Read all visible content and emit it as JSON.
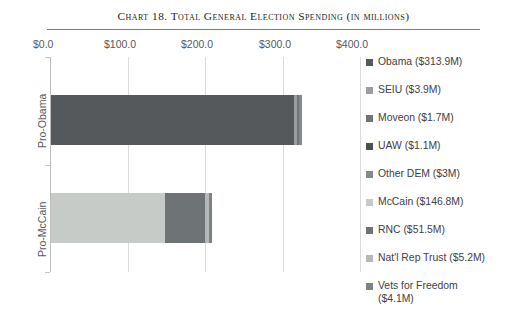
{
  "chart_data": {
    "type": "bar",
    "orientation": "horizontal",
    "stacked": true,
    "title": "Chart 18.  Total General Election Spending (in millions)",
    "xlabel": "",
    "ylabel": "",
    "categories": [
      "Pro-Obama",
      "Pro-McCain"
    ],
    "xlim": [
      0,
      400
    ],
    "xticks": [
      0,
      100,
      200,
      300,
      400
    ],
    "xtick_labels": [
      "$0.0",
      "$100.0",
      "$200.0",
      "$300.0",
      "$400.0"
    ],
    "grid": true,
    "legend_position": "right",
    "units": "millions of dollars",
    "series": [
      {
        "name": "Obama",
        "label": "Obama ($313.9M)",
        "color": "#55595b",
        "values": [
          313.9,
          0
        ]
      },
      {
        "name": "SEIU",
        "label": "SEIU ($3.9M)",
        "color": "#9b9fa1",
        "values": [
          3.9,
          0
        ]
      },
      {
        "name": "Moveon",
        "label": "Moveon ($1.7M)",
        "color": "#6f7477",
        "values": [
          1.7,
          0
        ]
      },
      {
        "name": "UAW",
        "label": "UAW ($1.1M)",
        "color": "#4d5153",
        "values": [
          1.1,
          0
        ]
      },
      {
        "name": "Other DEM",
        "label": "Other DEM ($3M)",
        "color": "#84888a",
        "values": [
          3.0,
          0
        ]
      },
      {
        "name": "McCain",
        "label": "McCain ($146.8M)",
        "color": "#c7cbc8",
        "values": [
          0,
          146.8
        ]
      },
      {
        "name": "RNC",
        "label": "RNC ($51.5M)",
        "color": "#6e7375",
        "values": [
          0,
          51.5
        ]
      },
      {
        "name": "Nat'l Rep Trust",
        "label": "Nat'l Rep Trust ($5.2M)",
        "color": "#b4b8b6",
        "values": [
          0,
          5.2
        ]
      },
      {
        "name": "Vets for Freedom",
        "label": "Vets for Freedom\n($4.1M)",
        "color": "#7e8284",
        "values": [
          0,
          4.1
        ]
      }
    ],
    "totals": [
      323.6,
      207.6
    ]
  },
  "axis": {
    "tick0": "$0.0",
    "tick1": "$100.0",
    "tick2": "$200.0",
    "tick3": "$300.0",
    "tick4": "$400.0",
    "cat0": "Pro-Obama",
    "cat1": "Pro-McCain"
  },
  "legend": {
    "items": [
      {
        "label": "Obama ($313.9M)"
      },
      {
        "label": "SEIU ($3.9M)"
      },
      {
        "label": "Moveon ($1.7M)"
      },
      {
        "label": "UAW ($1.1M)"
      },
      {
        "label": "Other DEM ($3M)"
      },
      {
        "label": "McCain ($146.8M)"
      },
      {
        "label": "RNC ($51.5M)"
      },
      {
        "label": "Nat'l Rep Trust ($5.2M)"
      },
      {
        "label": "Vets for Freedom\n($4.1M)"
      }
    ]
  },
  "title": {
    "text": "Chart 18.  Total General Election Spending (in millions)"
  }
}
